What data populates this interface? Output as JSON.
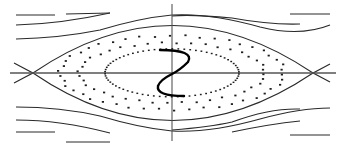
{
  "diagram": {
    "title": "",
    "type": "phase-portrait",
    "colors": {
      "background": "#ffffff",
      "line": "#2a2a2a",
      "axis": "#555555",
      "dots": "#1e1e1e",
      "bold_curve": "#000000"
    },
    "axes": {
      "horizontal": {
        "x1": 10,
        "y1": 73,
        "x2": 336,
        "y2": 73
      },
      "vertical": {
        "x1": 172,
        "y1": 4,
        "x2": 172,
        "y2": 141
      }
    },
    "x_points": [
      {
        "x": 33,
        "y": 73
      },
      {
        "x": 313,
        "y": 73
      }
    ],
    "separatrix": {
      "upper": "M14,63 L33,73 Q172,-22 313,73 L330,64",
      "lower": "M14,83 L33,73 Q172,168 313,73 L330,82"
    },
    "streamlines": [
      "M16,15 L55,15",
      "M16,25 Q60,24 110,13",
      "M16,39 Q60,38 100,30 Q140,18 172,15",
      "M172,15 Q210,13 260,27 Q300,37 330,25",
      "M66,14 L110,13",
      "M172,16 Q190,14 232,18",
      "M232,18 Q270,25 300,24",
      "M290,14 L330,14",
      "M16,120 Q60,120 110,133",
      "M16,107 Q60,107 100,116 Q140,128 172,131",
      "M172,131 Q210,133 260,119 Q300,108 330,108",
      "M16,132 L55,132",
      "M172,130 Q210,127 232,122 Q270,108 300,109",
      "M66,142 L110,142",
      "M232,132 Q270,124 300,121",
      "M290,135 L330,135"
    ],
    "outer_dot_ring": {
      "cx": 172,
      "cy": 73,
      "rx": 112,
      "ry": 37,
      "count": 46
    },
    "middle_dot_ring": {
      "cx": 172,
      "cy": 73,
      "rx": 93,
      "ry": 30,
      "count": 40
    },
    "inner_dotted_ellipse": {
      "cx": 172,
      "cy": 73,
      "rx": 67,
      "ry": 24,
      "count": 70
    },
    "s_curve": "M160,50 Q195,50 188,62 Q180,70 172,74 Q160,80 158,86 Q156,96 184,96"
  }
}
